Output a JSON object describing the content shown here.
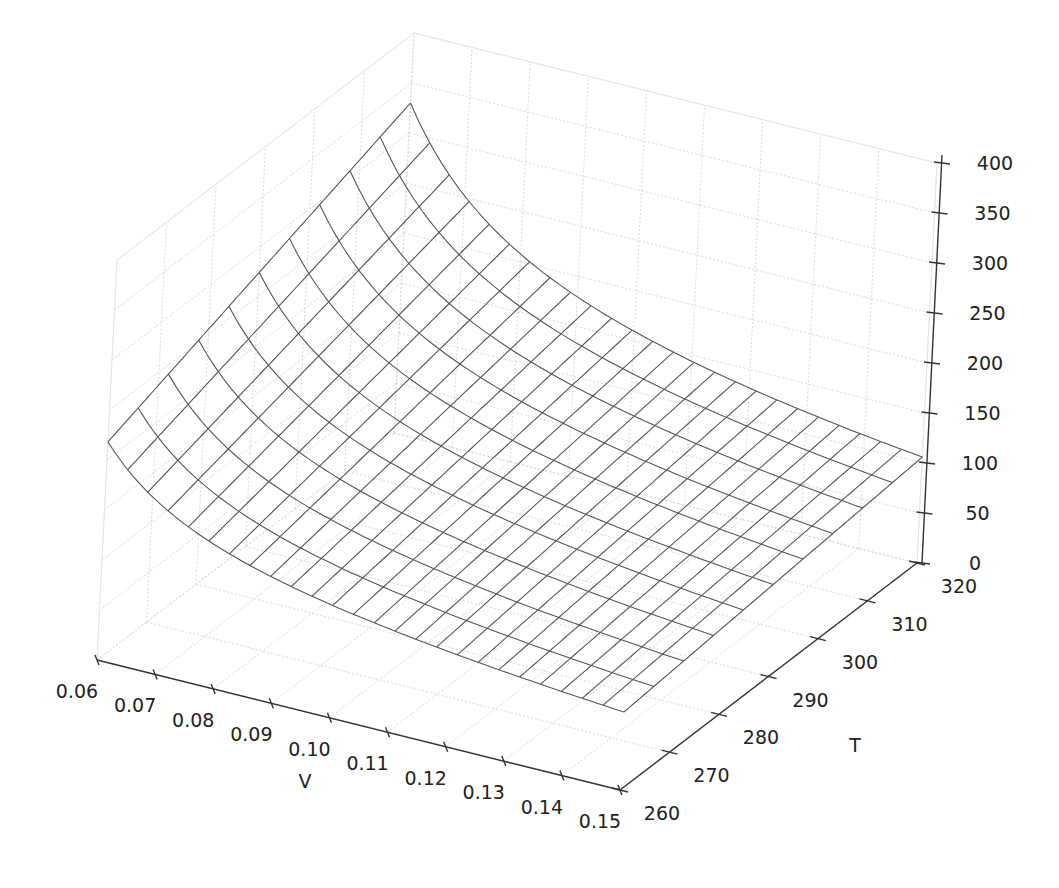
{
  "chart_data": {
    "type": "surface-wireframe-3d",
    "title": "",
    "xlabel": "V",
    "ylabel": "T",
    "zlabel": "",
    "x_range": [
      0.06,
      0.15
    ],
    "y_range": [
      260,
      320
    ],
    "z_range": [
      0,
      400
    ],
    "x_ticks": [
      "0.06",
      "0.07",
      "0.08",
      "0.09",
      "0.10",
      "0.11",
      "0.12",
      "0.13",
      "0.14",
      "0.15"
    ],
    "y_ticks": [
      "260",
      "270",
      "280",
      "290",
      "300",
      "310",
      "320"
    ],
    "z_ticks": [
      "0",
      "50",
      "100",
      "150",
      "200",
      "250",
      "300",
      "350",
      "400"
    ],
    "grid": true,
    "wire_color": "#555555",
    "surface_model": {
      "description": "pressure-like surface decreasing steeply with V, increasing with T",
      "formula": "z = a*T/(V-b) - c/V^2",
      "a": 0.0555,
      "b": 0.03,
      "c": 0.95,
      "v_lines": 26,
      "t_lines": 11
    },
    "sample_points": [
      {
        "V": 0.06,
        "T": 320,
        "z": 330
      },
      {
        "V": 0.06,
        "T": 260,
        "z": 217
      },
      {
        "V": 0.15,
        "T": 320,
        "z": 106
      },
      {
        "V": 0.15,
        "T": 260,
        "z": 78
      }
    ]
  }
}
